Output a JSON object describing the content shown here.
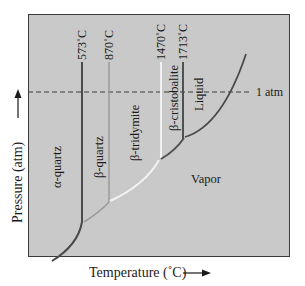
{
  "diagram": {
    "colors": {
      "plot_background": "#c9c9c9",
      "frame": "#3a3a3a",
      "alpha_quartz_line": "#4a4a4a",
      "beta_quartz_line": "#9a9a9a",
      "beta_tridymite_line": "#f2f2f2",
      "beta_cristobalite_line": "#505050",
      "liquid_line": "#4a4a4a",
      "dashed_line": "#3a3a3a"
    },
    "axes": {
      "x_label": "Temperature (˚C)",
      "y_label": "Pressure (atm)"
    },
    "reference_line": {
      "label": "1 atm"
    },
    "transition_temperatures": [
      {
        "label": "573˚C"
      },
      {
        "label": "870˚C"
      },
      {
        "label": "1470˚C"
      },
      {
        "label": "1713˚C"
      }
    ],
    "phases": [
      {
        "name": "α-quartz"
      },
      {
        "name": "β-quartz"
      },
      {
        "name": "β-tridymite"
      },
      {
        "name": "β-cristobalite"
      },
      {
        "name": "Liquid"
      },
      {
        "name": "Vapor"
      }
    ]
  }
}
